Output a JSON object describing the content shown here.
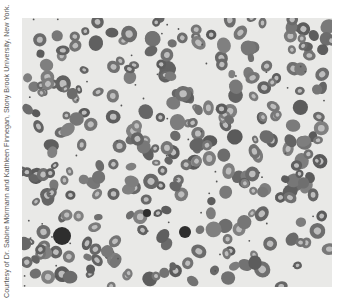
{
  "figure": {
    "credit": "Courtesy of Dr. Sabine Mörmann and Kathleen Finnegan, Stony Brook University, New York.",
    "colors": {
      "background": "#e9e9e7",
      "cell_rim": "#6f6f6f",
      "cell_center": "#bdbdbd",
      "dark_cell": "#2e2e2e"
    },
    "seed": 17,
    "cell_count": 320,
    "dark_cells": [
      {
        "x": 40,
        "y": 218,
        "r": 9
      },
      {
        "x": 163,
        "y": 214,
        "r": 6
      },
      {
        "x": 125,
        "y": 195,
        "r": 4
      }
    ]
  }
}
